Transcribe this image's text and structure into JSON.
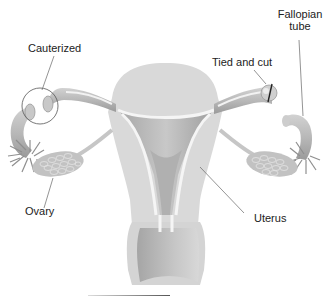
{
  "figure": {
    "colors": {
      "background": "#ffffff",
      "tissue_light": "#d9d9d9",
      "tissue_mid": "#bdbdbd",
      "tissue_dark": "#9e9e9e",
      "lining": "#f4f4f4",
      "ovary": "#c4c4c4",
      "label_text": "#222222",
      "leader_line": "#666666"
    }
  },
  "labels": {
    "cauterized": "Cauterized",
    "tied_and_cut": "Tied and cut",
    "fallopian_tube_line1": "Fallopian",
    "fallopian_tube_line2": "tube",
    "ovary": "Ovary",
    "uterus": "Uterus"
  }
}
